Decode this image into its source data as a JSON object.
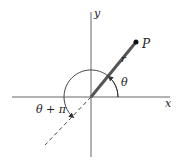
{
  "diagram": {
    "type": "polar-coordinates",
    "axes": {
      "x_label": "x",
      "y_label": "y"
    },
    "point": {
      "label": "P"
    },
    "radius_label": "r",
    "angle_label": "θ",
    "opposite_angle_label": "θ + π",
    "colors": {
      "axis": "#555555",
      "ray": "#555555",
      "text": "#222222"
    }
  }
}
